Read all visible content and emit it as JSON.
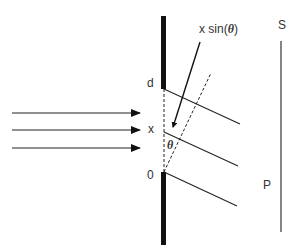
{
  "diagram": {
    "type": "single-slit diffraction",
    "labels": {
      "top_edge": "d",
      "mid_point": "x",
      "bottom_edge": "0",
      "path_difference": "x sin(θ)",
      "path_difference_prefix": "x sin(",
      "path_difference_theta": "θ",
      "path_difference_suffix": ")",
      "angle": "θ",
      "screen": "S",
      "point": "P"
    },
    "colors": {
      "barrier": "#111111",
      "lines": "#222222",
      "text": "#333333"
    },
    "incident_rays": 3,
    "diffracted_rays": 3
  }
}
